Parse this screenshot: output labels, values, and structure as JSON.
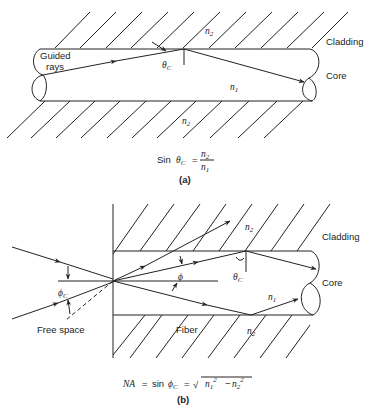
{
  "figure_a": {
    "label_guided": "Guided",
    "label_rays": "rays",
    "label_cladding": "Cladding",
    "label_core": "Core",
    "n_top": "n",
    "n_top_sub": "2",
    "n_bottom": "n",
    "n_bottom_sub": "2",
    "n_core": "n",
    "n_core_sub": "1",
    "theta": "θ",
    "theta_sub": "C",
    "equation_prefix": "Sin",
    "equation_theta": "θ",
    "equation_theta_sub": "C",
    "equation_eq": "=",
    "equation_num": "n",
    "equation_num_sub": "2",
    "equation_den": "n",
    "equation_den_sub": "1",
    "caption": "(a)"
  },
  "figure_b": {
    "label_cladding": "Cladding",
    "label_core": "Core",
    "label_free_space": "Free space",
    "label_fiber": "Fiber",
    "n_top": "n",
    "n_top_sub": "2",
    "n_bottom": "n",
    "n_bottom_sub": "2",
    "n_core": "n",
    "n_core_sub": "1",
    "phi_c": "ϕ",
    "phi_c_sub": "C",
    "phi": "ϕ",
    "phi_sub": "",
    "theta": "θ",
    "theta_sub": "C",
    "equation_na": "NA",
    "equation_eq1": "=",
    "equation_sin": "sin",
    "equation_phi": "ϕ",
    "equation_phi_sub": "C",
    "equation_eq2": "=",
    "equation_sqrt": "√",
    "equation_n1": "n",
    "equation_n1_sub": "1",
    "equation_sup1": "2",
    "equation_minus": "−",
    "equation_n2": "n",
    "equation_n2_sub": "2",
    "equation_sup2": "2",
    "caption": "(b)"
  }
}
